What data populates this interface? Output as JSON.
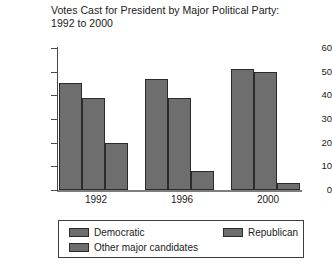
{
  "chart_data": {
    "type": "bar",
    "title": "Votes Cast for President by Major Political Party:\n1992 to 2000",
    "xlabel": "",
    "ylabel": "Millions of votes",
    "ylim": [
      0,
      60
    ],
    "yticks": [
      0,
      10,
      20,
      30,
      40,
      50,
      60
    ],
    "grid": false,
    "legend_position": "bottom",
    "categories": [
      "1992",
      "1996",
      "2000"
    ],
    "series": [
      {
        "name": "Democratic",
        "values": [
          45,
          47,
          51
        ],
        "color": "#6e6e6e"
      },
      {
        "name": "Republican",
        "values": [
          39,
          39,
          50
        ],
        "color": "#6e6e6e"
      },
      {
        "name": "Other major candidates",
        "values": [
          20,
          8,
          3
        ],
        "color": "#6e6e6e"
      }
    ]
  },
  "axes": {
    "y_title": "Millions of votes",
    "y_tick_labels": [
      "60",
      "50",
      "40",
      "30",
      "20",
      "10",
      "0"
    ],
    "x_tick_labels": [
      "1992",
      "1996",
      "2000"
    ]
  },
  "legend": {
    "democratic": "Democratic",
    "republican": "Republican",
    "other": "Other major candidates"
  }
}
